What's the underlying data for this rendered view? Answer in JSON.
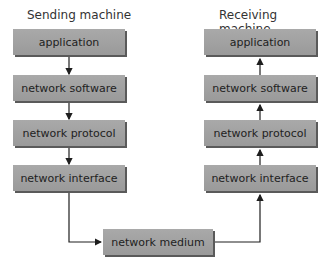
{
  "sending": {
    "title": "Sending machine",
    "layers": [
      "application",
      "network software",
      "network protocol",
      "network interface"
    ]
  },
  "receiving": {
    "title": "Receiving machine",
    "layers": [
      "application",
      "network software",
      "network protocol",
      "network interface"
    ]
  },
  "medium": {
    "label": "network medium"
  },
  "colors": {
    "box": "#a3a3a3",
    "shadow": "#5a5a5a",
    "arrow": "#1e1e1e"
  }
}
